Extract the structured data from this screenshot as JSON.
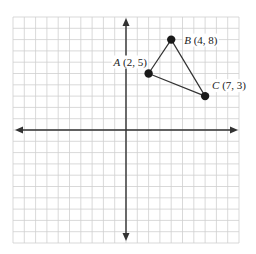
{
  "diagram": {
    "type": "coordinate-plane",
    "grid": {
      "min": -10,
      "max": 10,
      "step": 1,
      "origin_px": [
        126,
        130
      ],
      "unit_px": 11.3
    },
    "colors": {
      "grid": "#cfcfcf",
      "axis": "#333333",
      "triangle": "#333333",
      "point": "#1a1a1a"
    },
    "axes": {
      "arrows": true,
      "x_range": [
        -10,
        10
      ],
      "y_range": [
        -10,
        10
      ]
    },
    "points": [
      {
        "name": "A",
        "x": 2,
        "y": 5,
        "label_coords": "(2, 5)",
        "label_pos": "left"
      },
      {
        "name": "B",
        "x": 4,
        "y": 8,
        "label_coords": "(4, 8)",
        "label_pos": "right"
      },
      {
        "name": "C",
        "x": 7,
        "y": 3,
        "label_coords": "(7, 3)",
        "label_pos": "right"
      }
    ],
    "shape": {
      "type": "triangle",
      "vertices": [
        "A",
        "B",
        "C"
      ]
    }
  }
}
